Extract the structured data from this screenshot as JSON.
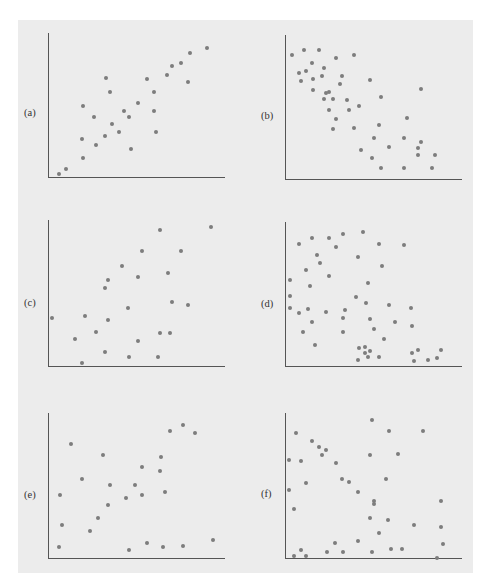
{
  "page_header": "",
  "chart_data": [
    {
      "type": "scatter",
      "label": "(a)",
      "title": "",
      "xlabel": "",
      "ylabel": "",
      "xlim": [
        0,
        100
      ],
      "ylim": [
        0,
        100
      ],
      "grid": false,
      "ticks": false,
      "points": [
        [
          6,
          3
        ],
        [
          10,
          6
        ],
        [
          20,
          50
        ],
        [
          19,
          27
        ],
        [
          20,
          14
        ],
        [
          26,
          42
        ],
        [
          27,
          23
        ],
        [
          32,
          29
        ],
        [
          33,
          69
        ],
        [
          35,
          59
        ],
        [
          36,
          37
        ],
        [
          40,
          32
        ],
        [
          43,
          46
        ],
        [
          46,
          42
        ],
        [
          47,
          20
        ],
        [
          51,
          52
        ],
        [
          56,
          68
        ],
        [
          60,
          46
        ],
        [
          60,
          59
        ],
        [
          61,
          32
        ],
        [
          67,
          71
        ],
        [
          70,
          77
        ],
        [
          75,
          79
        ],
        [
          79,
          66
        ],
        [
          80,
          86
        ],
        [
          90,
          90
        ]
      ]
    },
    {
      "type": "scatter",
      "label": "(b)",
      "title": "",
      "xlabel": "",
      "ylabel": "",
      "xlim": [
        0,
        100
      ],
      "ylim": [
        0,
        100
      ],
      "grid": false,
      "ticks": false,
      "points": [
        [
          4,
          86
        ],
        [
          11,
          90
        ],
        [
          19,
          90
        ],
        [
          15,
          81
        ],
        [
          8,
          74
        ],
        [
          12,
          75
        ],
        [
          9,
          68
        ],
        [
          16,
          70
        ],
        [
          22,
          77
        ],
        [
          21,
          72
        ],
        [
          29,
          84
        ],
        [
          39,
          86
        ],
        [
          32,
          72
        ],
        [
          31,
          66
        ],
        [
          16,
          62
        ],
        [
          23,
          60
        ],
        [
          25,
          61
        ],
        [
          22,
          56
        ],
        [
          27,
          56
        ],
        [
          35,
          55
        ],
        [
          25,
          48
        ],
        [
          36,
          48
        ],
        [
          42,
          51
        ],
        [
          29,
          42
        ],
        [
          27,
          35
        ],
        [
          39,
          36
        ],
        [
          48,
          69
        ],
        [
          54,
          57
        ],
        [
          53,
          38
        ],
        [
          50,
          29
        ],
        [
          43,
          21
        ],
        [
          49,
          15
        ],
        [
          54,
          8
        ],
        [
          59,
          23
        ],
        [
          67,
          29
        ],
        [
          69,
          43
        ],
        [
          77,
          63
        ],
        [
          67,
          8
        ],
        [
          75,
          22
        ],
        [
          77,
          26
        ],
        [
          75,
          17
        ],
        [
          85,
          17
        ],
        [
          83,
          8
        ]
      ]
    },
    {
      "type": "scatter",
      "label": "(c)",
      "title": "",
      "xlabel": "",
      "ylabel": "",
      "xlim": [
        0,
        100
      ],
      "ylim": [
        0,
        100
      ],
      "grid": false,
      "ticks": false,
      "points": [
        [
          2,
          33
        ],
        [
          15,
          19
        ],
        [
          19,
          3
        ],
        [
          21,
          35
        ],
        [
          27,
          24
        ],
        [
          32,
          10
        ],
        [
          34,
          32
        ],
        [
          32,
          54
        ],
        [
          34,
          59
        ],
        [
          42,
          69
        ],
        [
          45,
          40
        ],
        [
          51,
          61
        ],
        [
          53,
          79
        ],
        [
          51,
          18
        ],
        [
          46,
          7
        ],
        [
          63,
          93
        ],
        [
          68,
          64
        ],
        [
          70,
          44
        ],
        [
          63,
          23
        ],
        [
          69,
          23
        ],
        [
          62,
          7
        ],
        [
          75,
          79
        ],
        [
          79,
          42
        ],
        [
          92,
          95
        ]
      ]
    },
    {
      "type": "scatter",
      "label": "(d)",
      "title": "",
      "xlabel": "",
      "ylabel": "",
      "xlim": [
        0,
        100
      ],
      "ylim": [
        0,
        100
      ],
      "grid": false,
      "ticks": false,
      "points": [
        [
          8,
          85
        ],
        [
          15,
          89
        ],
        [
          25,
          89
        ],
        [
          33,
          92
        ],
        [
          44,
          93
        ],
        [
          29,
          83
        ],
        [
          18,
          77
        ],
        [
          20,
          72
        ],
        [
          12,
          67
        ],
        [
          3,
          60
        ],
        [
          14,
          56
        ],
        [
          25,
          63
        ],
        [
          41,
          76
        ],
        [
          53,
          85
        ],
        [
          67,
          84
        ],
        [
          55,
          70
        ],
        [
          47,
          58
        ],
        [
          3,
          49
        ],
        [
          3,
          41
        ],
        [
          8,
          37
        ],
        [
          13,
          40
        ],
        [
          15,
          31
        ],
        [
          10,
          24
        ],
        [
          23,
          38
        ],
        [
          34,
          39
        ],
        [
          33,
          34
        ],
        [
          33,
          24
        ],
        [
          40,
          48
        ],
        [
          46,
          44
        ],
        [
          48,
          33
        ],
        [
          50,
          26
        ],
        [
          59,
          43
        ],
        [
          62,
          31
        ],
        [
          71,
          41
        ],
        [
          72,
          28
        ],
        [
          56,
          19
        ],
        [
          17,
          15
        ],
        [
          42,
          13
        ],
        [
          45,
          14
        ],
        [
          45,
          10
        ],
        [
          48,
          11
        ],
        [
          47,
          7
        ],
        [
          53,
          7
        ],
        [
          41,
          5
        ],
        [
          72,
          10
        ],
        [
          75,
          12
        ],
        [
          73,
          4
        ],
        [
          81,
          5
        ],
        [
          86,
          6
        ],
        [
          88,
          12
        ]
      ]
    },
    {
      "type": "scatter",
      "label": "(e)",
      "title": "",
      "xlabel": "",
      "ylabel": "",
      "xlim": [
        0,
        100
      ],
      "ylim": [
        0,
        100
      ],
      "grid": false,
      "ticks": false,
      "points": [
        [
          6,
          8
        ],
        [
          8,
          23
        ],
        [
          7,
          44
        ],
        [
          13,
          79
        ],
        [
          19,
          55
        ],
        [
          24,
          19
        ],
        [
          28,
          28
        ],
        [
          31,
          71
        ],
        [
          34,
          37
        ],
        [
          35,
          51
        ],
        [
          44,
          42
        ],
        [
          46,
          6
        ],
        [
          49,
          51
        ],
        [
          53,
          63
        ],
        [
          53,
          44
        ],
        [
          56,
          11
        ],
        [
          63,
          60
        ],
        [
          64,
          70
        ],
        [
          66,
          46
        ],
        [
          65,
          8
        ],
        [
          69,
          88
        ],
        [
          76,
          92
        ],
        [
          83,
          86
        ],
        [
          76,
          9
        ],
        [
          93,
          13
        ]
      ]
    },
    {
      "type": "scatter",
      "label": "(f)",
      "title": "",
      "xlabel": "",
      "ylabel": "",
      "xlim": [
        0,
        100
      ],
      "ylim": [
        0,
        100
      ],
      "grid": false,
      "ticks": false,
      "points": [
        [
          6,
          86
        ],
        [
          2,
          68
        ],
        [
          9,
          67
        ],
        [
          15,
          81
        ],
        [
          19,
          77
        ],
        [
          23,
          75
        ],
        [
          21,
          71
        ],
        [
          29,
          66
        ],
        [
          12,
          52
        ],
        [
          2,
          47
        ],
        [
          5,
          34
        ],
        [
          32,
          55
        ],
        [
          36,
          53
        ],
        [
          41,
          46
        ],
        [
          49,
          95
        ],
        [
          48,
          71
        ],
        [
          59,
          88
        ],
        [
          64,
          72
        ],
        [
          78,
          88
        ],
        [
          57,
          55
        ],
        [
          50,
          40
        ],
        [
          50,
          38
        ],
        [
          48,
          28
        ],
        [
          58,
          27
        ],
        [
          53,
          18
        ],
        [
          73,
          23
        ],
        [
          88,
          40
        ],
        [
          88,
          22
        ],
        [
          89,
          10
        ],
        [
          5,
          2
        ],
        [
          9,
          6
        ],
        [
          12,
          2
        ],
        [
          24,
          5
        ],
        [
          28,
          11
        ],
        [
          33,
          5
        ],
        [
          41,
          12
        ],
        [
          49,
          5
        ],
        [
          60,
          7
        ],
        [
          66,
          7
        ],
        [
          86,
          1
        ]
      ]
    }
  ],
  "style": {
    "background": "#ececec",
    "dot_color": "#7d7d7d",
    "axis_color": "#555555"
  }
}
